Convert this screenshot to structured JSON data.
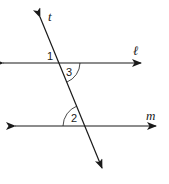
{
  "diagram": {
    "type": "parallel-lines-cut-by-transversal",
    "lines": [
      {
        "name": "l",
        "label": "ℓ",
        "from": [
          3,
          63
        ],
        "to": [
          141,
          63
        ]
      },
      {
        "name": "m",
        "label": "m",
        "from": [
          15,
          126
        ],
        "to": [
          156,
          126
        ]
      },
      {
        "name": "t",
        "label": "t",
        "from": [
          40,
          17
        ],
        "to": [
          102,
          168
        ]
      }
    ],
    "angles": [
      {
        "label": "1",
        "position": "upper-left at l ∩ t",
        "arc": false
      },
      {
        "label": "3",
        "position": "lower-right at l ∩ t",
        "arc": true
      },
      {
        "label": "2",
        "position": "upper-left at m ∩ t",
        "arc": true
      }
    ],
    "stroke_color": "#1a1a1a",
    "background": "#ffffff"
  }
}
